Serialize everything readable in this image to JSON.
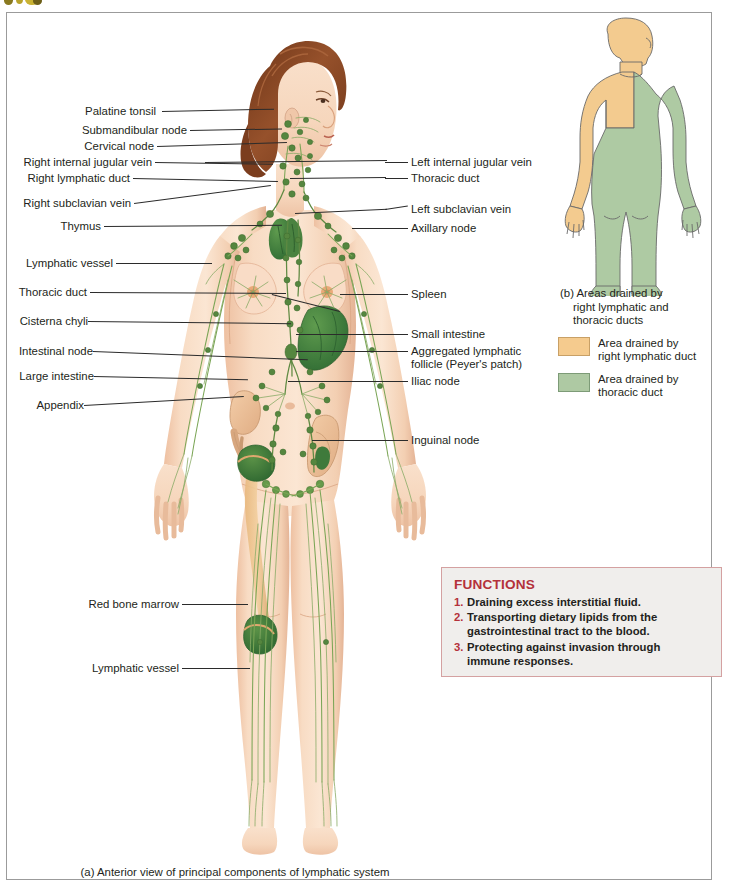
{
  "figure": {
    "caption_a": "(a) Anterior view of principal components of lymphatic system",
    "labels_left": [
      {
        "text": "Palatine tonsil"
      },
      {
        "text": "Submandibular node"
      },
      {
        "text": "Cervical node"
      },
      {
        "text": "Right internal jugular vein"
      },
      {
        "text": "Right lymphatic duct"
      },
      {
        "text": "Right subclavian vein"
      },
      {
        "text": "Thymus"
      },
      {
        "text": "Lymphatic vessel"
      },
      {
        "text": "Thoracic duct"
      },
      {
        "text": "Cisterna chyli"
      },
      {
        "text": "Intestinal node"
      },
      {
        "text": "Large intestine"
      },
      {
        "text": "Appendix"
      },
      {
        "text": "Red bone marrow"
      },
      {
        "text": "Lymphatic vessel"
      }
    ],
    "labels_right": [
      {
        "text": "Left internal jugular vein"
      },
      {
        "text": "Thoracic duct"
      },
      {
        "text": "Left subclavian vein"
      },
      {
        "text": "Axillary node"
      },
      {
        "text": "Spleen"
      },
      {
        "text": "Small intestine"
      },
      {
        "text": "Aggregated lymphatic"
      },
      {
        "text": "follicle (Peyer's patch)"
      },
      {
        "text": "Iliac node"
      },
      {
        "text": "Inguinal node"
      }
    ]
  },
  "panel_b": {
    "caption_prefix": "(b) Areas drained by",
    "caption_line2": "right lymphatic and",
    "caption_line3": "thoracic ducts",
    "legend": [
      {
        "swatch": "orange",
        "line1": "Area drained by",
        "line2": "right lymphatic duct",
        "color": "#f5cb8e"
      },
      {
        "swatch": "green",
        "line1": "Area drained by",
        "line2": "thoracic duct",
        "color": "#aec9a3"
      }
    ]
  },
  "functions_box": {
    "title": "FUNCTIONS",
    "items": [
      {
        "num": "1.",
        "line1": "Draining excess interstitial fluid.",
        "line2": ""
      },
      {
        "num": "2.",
        "line1": "Transporting dietary lipids from the",
        "line2": "gastrointestinal tract to the blood."
      },
      {
        "num": "3.",
        "line1": "Protecting against invasion through",
        "line2": "immune responses."
      }
    ]
  },
  "colors": {
    "skin": "#f7d9c0",
    "skin_shadow": "#eabd9c",
    "hair": "#8d4b2a",
    "lymph_green": "#6f9a4e",
    "organ_green": "#3f7a3b",
    "accent_red": "#b4313a",
    "panel_orange": "#f5cb8e",
    "panel_green": "#aec9a3"
  }
}
